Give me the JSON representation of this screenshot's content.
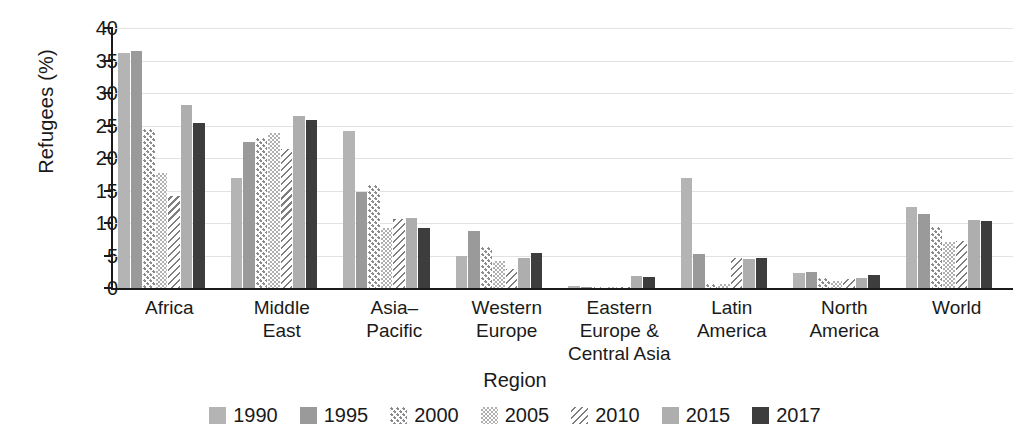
{
  "chart_data": {
    "type": "bar",
    "title": "",
    "xlabel": "Region",
    "ylabel": "Refugees (%)",
    "ylim": [
      0,
      40
    ],
    "yticks": [
      0,
      5,
      10,
      15,
      20,
      25,
      30,
      35,
      40
    ],
    "grid": true,
    "legend_position": "bottom",
    "categories": [
      "Africa",
      "Middle East",
      "Asia–Pacific",
      "Western Europe",
      "Eastern Europe & Central Asia",
      "Latin America",
      "North America",
      "World"
    ],
    "category_lines": [
      [
        "Africa"
      ],
      [
        "Middle",
        "East"
      ],
      [
        "Asia–",
        "Pacific"
      ],
      [
        "Western",
        "Europe"
      ],
      [
        "Eastern",
        "Europe &",
        "Central Asia"
      ],
      [
        "Latin",
        "America"
      ],
      [
        "North",
        "America"
      ],
      [
        "World"
      ]
    ],
    "series": [
      {
        "name": "1990",
        "pattern": "solid-light",
        "color": "#b4b4b4",
        "values": [
          36.2,
          16.9,
          24.2,
          4.9,
          0.3,
          16.9,
          2.3,
          12.5
        ]
      },
      {
        "name": "1995",
        "pattern": "solid-mid",
        "color": "#9a9a9a",
        "values": [
          36.4,
          22.5,
          14.7,
          8.8,
          0.2,
          5.3,
          2.5,
          11.4
        ]
      },
      {
        "name": "2000",
        "pattern": "dots",
        "color": "#8c8c8c",
        "values": [
          24.4,
          23.1,
          15.8,
          6.3,
          0.2,
          0.6,
          1.5,
          9.4
        ]
      },
      {
        "name": "2005",
        "pattern": "checker",
        "color": "#b0b0b0",
        "values": [
          17.7,
          23.8,
          9.2,
          4.1,
          0.2,
          0.6,
          1.1,
          7.1
        ]
      },
      {
        "name": "2010",
        "pattern": "diagonal",
        "color": "#7e7e7e",
        "values": [
          14.2,
          21.4,
          10.6,
          3.0,
          0.2,
          4.6,
          1.4,
          7.2
        ]
      },
      {
        "name": "2015",
        "pattern": "solid-light2",
        "color": "#aeaeae",
        "values": [
          28.2,
          26.4,
          10.7,
          4.6,
          1.8,
          4.5,
          1.6,
          10.4
        ]
      },
      {
        "name": "2017",
        "pattern": "dark",
        "color": "#3d3d3d",
        "values": [
          25.4,
          25.8,
          9.3,
          5.4,
          1.7,
          4.6,
          2.0,
          10.3
        ]
      }
    ]
  }
}
